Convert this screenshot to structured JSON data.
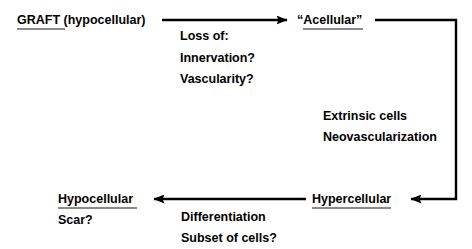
{
  "diagram": {
    "stroke_color": "#000000",
    "underline_color": "#8a8a8a",
    "background": "#ffffff",
    "nodes": [
      {
        "id": "graft",
        "emphasis": "GRAFT",
        "qualifier": " (hypocellular)"
      },
      {
        "id": "acellular",
        "emphasis": "“Acellular”",
        "qualifier": ""
      },
      {
        "id": "hypercellular",
        "emphasis": "Hypercellular",
        "qualifier": ""
      },
      {
        "id": "hypocellular",
        "emphasis": "Hypocellular",
        "qualifier": "",
        "subtext": "Scar?"
      }
    ],
    "edge_annotations": [
      {
        "id": "graft-to-acellular",
        "lines": [
          "Loss of:",
          "Innervation?",
          "Vascularity?"
        ]
      },
      {
        "id": "acellular-to-hypercellular",
        "lines": [
          "Extrinsic cells",
          "Neovascularization"
        ]
      },
      {
        "id": "hypercellular-to-hypocellular",
        "lines": [
          "Differentiation",
          "Subset of cells?"
        ]
      }
    ]
  }
}
